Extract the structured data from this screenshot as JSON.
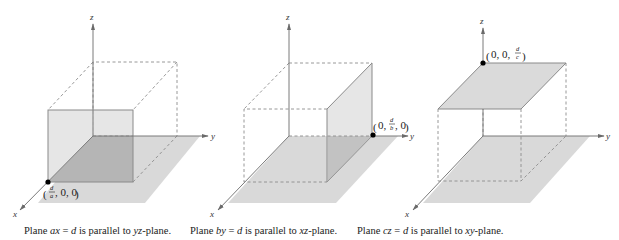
{
  "figures": [
    {
      "id": "plane-ax-d",
      "axes": {
        "x": "x",
        "y": "y",
        "z": "z"
      },
      "point": {
        "open": "(",
        "num": "d",
        "den": "a",
        "rest": ", 0, 0",
        "close": ")"
      },
      "caption": {
        "pre": "Plane ",
        "eq_var": "ax",
        "eq_mid": " = ",
        "eq_rhs": "d",
        "post_pre": " is parallel to ",
        "plane": "yz",
        "post": "-plane."
      }
    },
    {
      "id": "plane-by-d",
      "axes": {
        "x": "x",
        "y": "y",
        "z": "z"
      },
      "point": {
        "open": "(",
        "pre": "0, ",
        "num": "d",
        "den": "b",
        "rest": ", 0",
        "close": ")"
      },
      "caption": {
        "pre": "Plane ",
        "eq_var": "by",
        "eq_mid": " = ",
        "eq_rhs": "d",
        "post_pre": " is parallel to ",
        "plane": "xz",
        "post": "-plane."
      }
    },
    {
      "id": "plane-cz-d",
      "axes": {
        "x": "x",
        "y": "y",
        "z": "z"
      },
      "point": {
        "open": "(",
        "pre": "0, 0, ",
        "num": "d",
        "den": "c",
        "close": ")"
      },
      "caption": {
        "pre": "Plane ",
        "eq_var": "cz",
        "eq_mid": " = ",
        "eq_rhs": "d",
        "post_pre": " is parallel to ",
        "plane": "xy",
        "post": "-plane."
      }
    }
  ],
  "colors": {
    "floor": "#d9d9d9",
    "overlap": "#b5b5b5",
    "plane": "#e2e2e2",
    "axis": "#7a7a7a",
    "dash": "#8c8c8c",
    "point": "#000000"
  }
}
